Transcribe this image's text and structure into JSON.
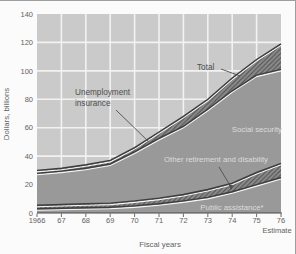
{
  "colors": {
    "page_bg": "#fbfbfb",
    "frame": "#9e9e9e",
    "plot_bg": "#cacaca",
    "grid": "#f2f2f2",
    "area_solid": "#999999",
    "hatch_bg": "#8b8b8b",
    "hatch_line": "#4e4e4e",
    "boundary": "#3d3d3d",
    "boundary_highlight": "#f6f6f6",
    "axis_line": "#474747",
    "axis_text": "#636363",
    "label_dark": "#4f4f4f",
    "label_light": "#dcdcdc"
  },
  "chart_data": {
    "type": "area",
    "stacked": true,
    "title": "",
    "xlabel": "Fiscal years",
    "ylabel": "Dollars, billions",
    "estimate_note": "Estimate",
    "grid": true,
    "legend_position": "inline-annotations",
    "years": [
      1966,
      1967,
      1968,
      1969,
      1970,
      1971,
      1972,
      1973,
      1974,
      1975,
      1976
    ],
    "x_tick_labels": [
      "1966",
      "67",
      "68",
      "69",
      "70",
      "71",
      "72",
      "73",
      "74",
      "75",
      "76"
    ],
    "ylim": [
      0,
      140
    ],
    "y_ticks": [
      0,
      20,
      40,
      60,
      80,
      100,
      120,
      140
    ],
    "series": [
      {
        "name": "Public assistance*",
        "style": "solid",
        "values": [
          3,
          3.3,
          3.7,
          4,
          5,
          6.5,
          8.5,
          11,
          15,
          20,
          25
        ]
      },
      {
        "name": "Other retirement and disability",
        "style": "hatch",
        "values": [
          2.5,
          2.7,
          2.8,
          3,
          3.5,
          4,
          4.5,
          5.5,
          6,
          8.5,
          10
        ]
      },
      {
        "name": "Social security",
        "style": "solid",
        "values": [
          22.5,
          23.5,
          25,
          27.5,
          34.5,
          42,
          48,
          56.5,
          65,
          68.5,
          66
        ]
      },
      {
        "name": "Unemployment insurance",
        "style": "hatch",
        "values": [
          2,
          2,
          2.5,
          2.5,
          3,
          4.5,
          7,
          7,
          9,
          11,
          18
        ]
      }
    ],
    "total_label": "Total",
    "totals": [
      30,
      31.5,
      34,
      37,
      46,
      57,
      68,
      80,
      95,
      108,
      119
    ]
  },
  "annotations": {
    "unemployment_line1": "Unemployment",
    "unemployment_line2": "insurance",
    "total": "Total",
    "social_security": "Social security",
    "other_retirement": "Other retirement and disability",
    "public_assistance": "Public assistance*"
  }
}
